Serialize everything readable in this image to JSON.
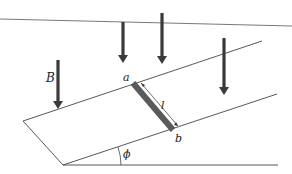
{
  "labels": {
    "field": "B",
    "end_a": "a",
    "end_b": "b",
    "length": "l",
    "angle": "ϕ"
  },
  "colors": {
    "line": "#444444",
    "arrow": "#3a3a3a",
    "rod": "#5a5a5a",
    "background": "#ffffff"
  },
  "elements": {
    "field_arrows": 4,
    "rails": 2,
    "rod": "sliding conducting rod ab of length l on inclined rails at angle phi"
  }
}
